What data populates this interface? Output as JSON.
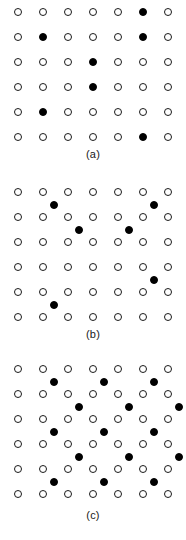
{
  "figure": {
    "background_color": "#ffffff",
    "open_site_color": "#ffffff",
    "open_site_stroke": "#1a1a1a",
    "filled_site_color": "#000000",
    "columns": 7,
    "col_start_x": 18,
    "col_spacing": 25,
    "site_diameter": 8
  },
  "panels": [
    {
      "id": "panel-a",
      "caption": "(a)",
      "top": 0,
      "caption_top": 148,
      "row_start_y": 12,
      "row_spacing": 25,
      "rows": 6,
      "lattice_height": 145,
      "open_sites": [
        {
          "row": 0,
          "col": 0
        },
        {
          "row": 0,
          "col": 1
        },
        {
          "row": 0,
          "col": 2
        },
        {
          "row": 0,
          "col": 3
        },
        {
          "row": 0,
          "col": 4
        },
        {
          "row": 0,
          "col": 6
        },
        {
          "row": 1,
          "col": 0
        },
        {
          "row": 1,
          "col": 2
        },
        {
          "row": 1,
          "col": 3
        },
        {
          "row": 1,
          "col": 4
        },
        {
          "row": 1,
          "col": 6
        },
        {
          "row": 2,
          "col": 0
        },
        {
          "row": 2,
          "col": 1
        },
        {
          "row": 2,
          "col": 2
        },
        {
          "row": 2,
          "col": 4
        },
        {
          "row": 2,
          "col": 5
        },
        {
          "row": 2,
          "col": 6
        },
        {
          "row": 3,
          "col": 0
        },
        {
          "row": 3,
          "col": 1
        },
        {
          "row": 3,
          "col": 2
        },
        {
          "row": 3,
          "col": 4
        },
        {
          "row": 3,
          "col": 5
        },
        {
          "row": 3,
          "col": 6
        },
        {
          "row": 4,
          "col": 0
        },
        {
          "row": 4,
          "col": 2
        },
        {
          "row": 4,
          "col": 3
        },
        {
          "row": 4,
          "col": 4
        },
        {
          "row": 4,
          "col": 5
        },
        {
          "row": 4,
          "col": 6
        },
        {
          "row": 5,
          "col": 0
        },
        {
          "row": 5,
          "col": 1
        },
        {
          "row": 5,
          "col": 2
        },
        {
          "row": 5,
          "col": 3
        },
        {
          "row": 5,
          "col": 4
        },
        {
          "row": 5,
          "col": 6
        }
      ],
      "filled_sites": [
        {
          "row": 0,
          "col": 5
        },
        {
          "row": 1,
          "col": 1
        },
        {
          "row": 1,
          "col": 5
        },
        {
          "row": 2,
          "col": 3
        },
        {
          "row": 3,
          "col": 3
        },
        {
          "row": 4,
          "col": 1
        },
        {
          "row": 5,
          "col": 5
        }
      ]
    },
    {
      "id": "panel-b",
      "caption": "(b)",
      "top": 180,
      "caption_top": 148,
      "row_start_y": 12,
      "row_spacing": 25,
      "rows": 6,
      "lattice_height": 145,
      "open_sites": [
        {
          "row": 0,
          "col": 0
        },
        {
          "row": 0,
          "col": 1
        },
        {
          "row": 0,
          "col": 2
        },
        {
          "row": 0,
          "col": 3
        },
        {
          "row": 0,
          "col": 4
        },
        {
          "row": 0,
          "col": 5
        },
        {
          "row": 0,
          "col": 6
        },
        {
          "row": 1,
          "col": 0
        },
        {
          "row": 1,
          "col": 1
        },
        {
          "row": 1,
          "col": 2
        },
        {
          "row": 1,
          "col": 3
        },
        {
          "row": 1,
          "col": 4
        },
        {
          "row": 1,
          "col": 5
        },
        {
          "row": 1,
          "col": 6
        },
        {
          "row": 2,
          "col": 0
        },
        {
          "row": 2,
          "col": 1
        },
        {
          "row": 2,
          "col": 2
        },
        {
          "row": 2,
          "col": 3
        },
        {
          "row": 2,
          "col": 4
        },
        {
          "row": 2,
          "col": 5
        },
        {
          "row": 2,
          "col": 6
        },
        {
          "row": 3,
          "col": 0
        },
        {
          "row": 3,
          "col": 1
        },
        {
          "row": 3,
          "col": 2
        },
        {
          "row": 3,
          "col": 3
        },
        {
          "row": 3,
          "col": 4
        },
        {
          "row": 3,
          "col": 5
        },
        {
          "row": 3,
          "col": 6
        },
        {
          "row": 4,
          "col": 0
        },
        {
          "row": 4,
          "col": 1
        },
        {
          "row": 4,
          "col": 2
        },
        {
          "row": 4,
          "col": 3
        },
        {
          "row": 4,
          "col": 4
        },
        {
          "row": 4,
          "col": 5
        },
        {
          "row": 4,
          "col": 6
        },
        {
          "row": 5,
          "col": 0
        },
        {
          "row": 5,
          "col": 1
        },
        {
          "row": 5,
          "col": 2
        },
        {
          "row": 5,
          "col": 3
        },
        {
          "row": 5,
          "col": 4
        },
        {
          "row": 5,
          "col": 5
        },
        {
          "row": 5,
          "col": 6
        }
      ],
      "filled_sites": [
        {
          "row": 0.5,
          "col": 1.45
        },
        {
          "row": 0.5,
          "col": 5.45
        },
        {
          "row": 1.5,
          "col": 2.45
        },
        {
          "row": 1.5,
          "col": 4.45
        },
        {
          "row": 3.5,
          "col": 5.45
        },
        {
          "row": 4.5,
          "col": 1.45
        }
      ]
    },
    {
      "id": "panel-c",
      "caption": "(c)",
      "top": 357,
      "caption_top": 152,
      "row_start_y": 12,
      "row_spacing": 25,
      "rows": 6,
      "lattice_height": 148,
      "open_sites": [
        {
          "row": 0,
          "col": 0
        },
        {
          "row": 0,
          "col": 1
        },
        {
          "row": 0,
          "col": 2
        },
        {
          "row": 0,
          "col": 3
        },
        {
          "row": 0,
          "col": 4
        },
        {
          "row": 0,
          "col": 5
        },
        {
          "row": 0,
          "col": 6
        },
        {
          "row": 1,
          "col": 0
        },
        {
          "row": 1,
          "col": 1
        },
        {
          "row": 1,
          "col": 2
        },
        {
          "row": 1,
          "col": 3
        },
        {
          "row": 1,
          "col": 4
        },
        {
          "row": 1,
          "col": 5
        },
        {
          "row": 1,
          "col": 6
        },
        {
          "row": 2,
          "col": 0
        },
        {
          "row": 2,
          "col": 1
        },
        {
          "row": 2,
          "col": 2
        },
        {
          "row": 2,
          "col": 3
        },
        {
          "row": 2,
          "col": 4
        },
        {
          "row": 2,
          "col": 5
        },
        {
          "row": 2,
          "col": 6
        },
        {
          "row": 3,
          "col": 0
        },
        {
          "row": 3,
          "col": 1
        },
        {
          "row": 3,
          "col": 2
        },
        {
          "row": 3,
          "col": 3
        },
        {
          "row": 3,
          "col": 4
        },
        {
          "row": 3,
          "col": 5
        },
        {
          "row": 3,
          "col": 6
        },
        {
          "row": 4,
          "col": 0
        },
        {
          "row": 4,
          "col": 1
        },
        {
          "row": 4,
          "col": 2
        },
        {
          "row": 4,
          "col": 3
        },
        {
          "row": 4,
          "col": 4
        },
        {
          "row": 4,
          "col": 5
        },
        {
          "row": 4,
          "col": 6
        },
        {
          "row": 5,
          "col": 0
        },
        {
          "row": 5,
          "col": 1
        },
        {
          "row": 5,
          "col": 2
        },
        {
          "row": 5,
          "col": 3
        },
        {
          "row": 5,
          "col": 4
        },
        {
          "row": 5,
          "col": 5
        },
        {
          "row": 5,
          "col": 6
        }
      ],
      "filled_sites": [
        {
          "row": 0.5,
          "col": 1.45
        },
        {
          "row": 0.5,
          "col": 3.45
        },
        {
          "row": 0.5,
          "col": 5.45
        },
        {
          "row": 1.5,
          "col": 2.45
        },
        {
          "row": 1.5,
          "col": 4.45
        },
        {
          "row": 1.5,
          "col": 6.45
        },
        {
          "row": 2.5,
          "col": 1.45
        },
        {
          "row": 2.5,
          "col": 3.45
        },
        {
          "row": 2.5,
          "col": 5.45
        },
        {
          "row": 3.5,
          "col": 2.45
        },
        {
          "row": 3.5,
          "col": 4.45
        },
        {
          "row": 3.5,
          "col": 6.45
        },
        {
          "row": 4.5,
          "col": 1.45
        },
        {
          "row": 4.5,
          "col": 3.45
        },
        {
          "row": 4.5,
          "col": 5.45
        }
      ]
    }
  ]
}
